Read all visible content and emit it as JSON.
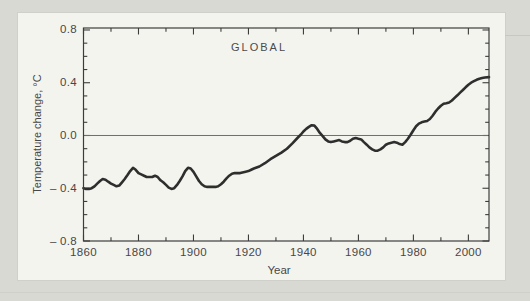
{
  "page": {
    "background_color": "#d8d9d3",
    "panel_background_color": "#f4f4ef"
  },
  "chart": {
    "panel_title": "GLOBAL",
    "x_axis_label": "Year",
    "y_axis_label": "Temperature change, °C"
  },
  "colors": {
    "axis": "#3c3c3c",
    "curve": "#2e2e2e",
    "zero_line": "#6f6f6f",
    "text": "#474747"
  },
  "chart_data": {
    "type": "line",
    "title": "GLOBAL",
    "xlabel": "Year",
    "ylabel": "Temperature change, °C",
    "xlim": [
      1860,
      2007.5
    ],
    "ylim": [
      -0.8,
      0.815
    ],
    "grid": false,
    "legend": "none",
    "reference_line_y": 0.0,
    "x_major_ticks": [
      1860,
      1880,
      1900,
      1920,
      1940,
      1960,
      1980,
      2000
    ],
    "x_tick_labels": [
      "1860",
      "1880",
      "1900",
      "1920",
      "1940",
      "1960",
      "1980",
      "2000"
    ],
    "x_minor_ticks": [
      1870,
      1890,
      1910,
      1930,
      1950,
      1970,
      1990
    ],
    "y_major_ticks": [
      0.8,
      0.4,
      0.0,
      -0.4,
      -0.8
    ],
    "y_tick_labels": [
      "0.8",
      "0.4",
      "0.0",
      "– 0.4",
      "– 0.8"
    ],
    "y_minor_ticks": [
      0.7,
      0.6,
      0.5,
      0.3,
      0.2,
      0.1,
      -0.1,
      -0.2,
      -0.3,
      -0.5,
      -0.6,
      -0.7
    ],
    "series": [
      {
        "name": "global-mean-temperature-anomaly-smoothed",
        "color": "#2e2e2e",
        "points": [
          [
            1860,
            -0.4
          ],
          [
            1861,
            -0.405
          ],
          [
            1862,
            -0.405
          ],
          [
            1863,
            -0.4
          ],
          [
            1864,
            -0.385
          ],
          [
            1865,
            -0.365
          ],
          [
            1866,
            -0.345
          ],
          [
            1867,
            -0.33
          ],
          [
            1868,
            -0.335
          ],
          [
            1869,
            -0.35
          ],
          [
            1870,
            -0.365
          ],
          [
            1871,
            -0.375
          ],
          [
            1872,
            -0.385
          ],
          [
            1873,
            -0.38
          ],
          [
            1874,
            -0.355
          ],
          [
            1875,
            -0.33
          ],
          [
            1876,
            -0.3
          ],
          [
            1877,
            -0.27
          ],
          [
            1878,
            -0.245
          ],
          [
            1879,
            -0.26
          ],
          [
            1880,
            -0.285
          ],
          [
            1881,
            -0.295
          ],
          [
            1882,
            -0.305
          ],
          [
            1883,
            -0.315
          ],
          [
            1884,
            -0.315
          ],
          [
            1885,
            -0.315
          ],
          [
            1886,
            -0.305
          ],
          [
            1887,
            -0.315
          ],
          [
            1888,
            -0.34
          ],
          [
            1889,
            -0.355
          ],
          [
            1890,
            -0.375
          ],
          [
            1891,
            -0.395
          ],
          [
            1892,
            -0.405
          ],
          [
            1893,
            -0.4
          ],
          [
            1894,
            -0.375
          ],
          [
            1895,
            -0.345
          ],
          [
            1896,
            -0.31
          ],
          [
            1897,
            -0.27
          ],
          [
            1898,
            -0.245
          ],
          [
            1899,
            -0.25
          ],
          [
            1900,
            -0.275
          ],
          [
            1901,
            -0.31
          ],
          [
            1902,
            -0.345
          ],
          [
            1903,
            -0.37
          ],
          [
            1904,
            -0.385
          ],
          [
            1905,
            -0.39
          ],
          [
            1906,
            -0.39
          ],
          [
            1908,
            -0.39
          ],
          [
            1909,
            -0.385
          ],
          [
            1910,
            -0.37
          ],
          [
            1911,
            -0.35
          ],
          [
            1912,
            -0.325
          ],
          [
            1913,
            -0.305
          ],
          [
            1914,
            -0.29
          ],
          [
            1915,
            -0.285
          ],
          [
            1917,
            -0.285
          ],
          [
            1919,
            -0.275
          ],
          [
            1920,
            -0.27
          ],
          [
            1921,
            -0.26
          ],
          [
            1922,
            -0.25
          ],
          [
            1924,
            -0.235
          ],
          [
            1926,
            -0.21
          ],
          [
            1928,
            -0.18
          ],
          [
            1930,
            -0.155
          ],
          [
            1932,
            -0.13
          ],
          [
            1934,
            -0.1
          ],
          [
            1936,
            -0.06
          ],
          [
            1938,
            -0.015
          ],
          [
            1939,
            0.005
          ],
          [
            1940,
            0.03
          ],
          [
            1941,
            0.05
          ],
          [
            1942,
            0.065
          ],
          [
            1943,
            0.078
          ],
          [
            1944,
            0.075
          ],
          [
            1945,
            0.05
          ],
          [
            1946,
            0.02
          ],
          [
            1947,
            -0.005
          ],
          [
            1948,
            -0.03
          ],
          [
            1949,
            -0.045
          ],
          [
            1950,
            -0.05
          ],
          [
            1951,
            -0.045
          ],
          [
            1953,
            -0.035
          ],
          [
            1954,
            -0.045
          ],
          [
            1955,
            -0.05
          ],
          [
            1956,
            -0.05
          ],
          [
            1957,
            -0.04
          ],
          [
            1958,
            -0.025
          ],
          [
            1959,
            -0.02
          ],
          [
            1960,
            -0.025
          ],
          [
            1961,
            -0.03
          ],
          [
            1962,
            -0.05
          ],
          [
            1963,
            -0.07
          ],
          [
            1964,
            -0.09
          ],
          [
            1965,
            -0.105
          ],
          [
            1966,
            -0.115
          ],
          [
            1967,
            -0.115
          ],
          [
            1968,
            -0.105
          ],
          [
            1969,
            -0.09
          ],
          [
            1970,
            -0.07
          ],
          [
            1971,
            -0.06
          ],
          [
            1972,
            -0.055
          ],
          [
            1973,
            -0.05
          ],
          [
            1974,
            -0.055
          ],
          [
            1975,
            -0.065
          ],
          [
            1976,
            -0.07
          ],
          [
            1977,
            -0.05
          ],
          [
            1978,
            -0.025
          ],
          [
            1979,
            0.005
          ],
          [
            1980,
            0.04
          ],
          [
            1981,
            0.07
          ],
          [
            1982,
            0.09
          ],
          [
            1983,
            0.1
          ],
          [
            1984,
            0.105
          ],
          [
            1985,
            0.11
          ],
          [
            1986,
            0.125
          ],
          [
            1987,
            0.15
          ],
          [
            1988,
            0.18
          ],
          [
            1989,
            0.205
          ],
          [
            1990,
            0.225
          ],
          [
            1991,
            0.24
          ],
          [
            1992,
            0.245
          ],
          [
            1993,
            0.25
          ],
          [
            1994,
            0.265
          ],
          [
            1995,
            0.285
          ],
          [
            1996,
            0.305
          ],
          [
            1997,
            0.325
          ],
          [
            1998,
            0.345
          ],
          [
            1999,
            0.365
          ],
          [
            2000,
            0.385
          ],
          [
            2001,
            0.4
          ],
          [
            2002,
            0.412
          ],
          [
            2003,
            0.422
          ],
          [
            2004,
            0.43
          ],
          [
            2005,
            0.435
          ],
          [
            2006,
            0.44
          ],
          [
            2007.5,
            0.443
          ]
        ]
      }
    ]
  }
}
